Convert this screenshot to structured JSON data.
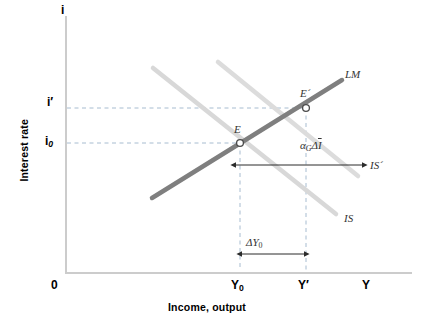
{
  "figure": {
    "type": "IS-LM macroeconomic diagram",
    "background_color": "#ffffff"
  },
  "axes": {
    "y_axis_title": "Interest rate",
    "y_axis_symbol": "i",
    "x_axis_title": "Income, output",
    "x_axis_symbol": "Y",
    "origin_label": "0",
    "axis_color": "#c9c9c9"
  },
  "ticks": {
    "y": [
      {
        "label_html": "i<span class=\"sub\">0</span>",
        "plain": "i0",
        "value_px": 142
      },
      {
        "label_html": "i′",
        "plain": "i'",
        "value_px": 103
      }
    ],
    "x": [
      {
        "label_html": "Y<span class=\"subn\">0</span>",
        "plain": "Y0",
        "value_px": 240
      },
      {
        "label_html": "Y′",
        "plain": "Y'",
        "value_px": 306
      }
    ]
  },
  "curves": [
    {
      "name": "LM",
      "label": "LM",
      "color": "#808080",
      "width": 4,
      "x1": 152,
      "y1": 198,
      "x2": 342,
      "y2": 80
    },
    {
      "name": "IS",
      "label": "IS",
      "color": "#d6d6d6",
      "width": 4,
      "x1": 153,
      "y1": 68,
      "x2": 336,
      "y2": 214
    },
    {
      "name": "IS-prime",
      "label": "IS´",
      "color": "#d6d6d6",
      "width": 4,
      "x1": 218,
      "y1": 62,
      "x2": 358,
      "y2": 176
    }
  ],
  "points": [
    {
      "name": "E",
      "label": "E",
      "x": 240,
      "y": 143
    },
    {
      "name": "E'",
      "label": "E´",
      "x": 306,
      "y": 108
    }
  ],
  "annotations": {
    "shift_label_html": "α<span class=\"sub\">G</span>Δ<span class=\"ovl\">I</span>",
    "shift_label_plain": "α_G ΔĪ",
    "output_change_html": "ΔY<span class=\"subn\">0</span>",
    "output_change_plain": "ΔY0"
  },
  "guide_lines": {
    "color": "#9fb4c7",
    "style": "dashed"
  }
}
